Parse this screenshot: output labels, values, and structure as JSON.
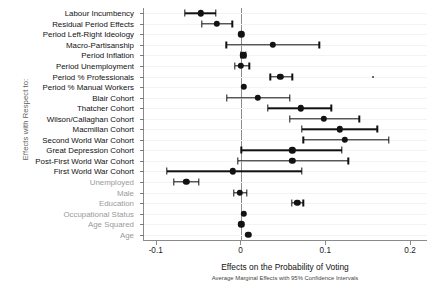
{
  "chart_data": {
    "type": "scatter",
    "title": "",
    "xlabel": "Effects on the Probability of Voting",
    "subcaption": "Average Marginal Effects with 95% Confidence Intervals",
    "ylabel": "Effects with Respect to:",
    "xlim": [
      -0.115,
      0.22
    ],
    "xticks": [
      -0.1,
      0,
      0.1,
      0.2
    ],
    "xticklabels": [
      "-0.1",
      "0",
      "0.1",
      "0.2"
    ],
    "grid": true,
    "legend": null,
    "reference_line_x": 0,
    "categories": [
      "Labour Incumbency",
      "Residual Period Effects",
      "Period Left-Right Ideology",
      "Macro-Partisanship",
      "Period Inflation",
      "Period Unemployment",
      "Period % Professionals",
      "Period % Manual Workers",
      "Blair Cohort",
      "Thatcher Cohort",
      "Wilson/Callaghan Cohort",
      "Macmillan Cohort",
      "Second World War Cohort",
      "Great Depression Cohort",
      "Post-First World War Cohort",
      "First World War Cohort",
      "Unemployed",
      "Male",
      "Education",
      "Occupational Status",
      "Age Squared",
      "Age"
    ],
    "category_styles": [
      "dark",
      "dark",
      "dark",
      "dark",
      "dark",
      "dark",
      "dark",
      "dark",
      "dark",
      "dark",
      "dark",
      "dark",
      "dark",
      "dark",
      "dark",
      "dark",
      "dim",
      "dim",
      "dim",
      "dim",
      "dim",
      "dim"
    ],
    "estimates": [
      -0.048,
      -0.029,
      0.0,
      0.037,
      0.002,
      -0.001,
      0.046,
      0.003,
      0.019,
      0.07,
      0.097,
      0.116,
      0.122,
      0.06,
      0.06,
      -0.01,
      -0.065,
      -0.002,
      0.066,
      0.003,
      0.0,
      0.008
    ],
    "ci_low": [
      -0.067,
      -0.047,
      0.0,
      -0.018,
      -0.001,
      -0.008,
      0.034,
      0.003,
      -0.017,
      0.031,
      0.057,
      0.071,
      0.073,
      0.0,
      -0.004,
      -0.088,
      -0.08,
      -0.009,
      0.059,
      0.003,
      0.0,
      0.008
    ],
    "ci_high": [
      -0.03,
      -0.011,
      0.0,
      0.092,
      0.005,
      0.009,
      0.06,
      0.003,
      0.057,
      0.106,
      0.139,
      0.16,
      0.174,
      0.118,
      0.126,
      0.071,
      -0.05,
      0.006,
      0.073,
      0.003,
      0.0,
      0.008
    ],
    "stray_marker": {
      "x": 0.155,
      "category_index": 6
    }
  }
}
